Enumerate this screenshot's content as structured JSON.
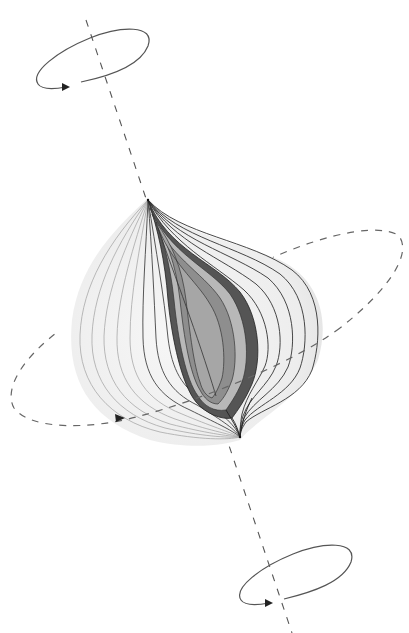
{
  "diagram": {
    "colors": {
      "background": "#ffffff",
      "axis": "#555555",
      "ring": "#555555",
      "equator_ring": "#666666",
      "field_line": "#222222",
      "faint_line": "#999999",
      "halo": "#ececec",
      "shell_dark": "#555555",
      "shell_mid": "#8a8a8a",
      "shell_light": "#b4b4b4",
      "shell_core": "#a0a0a0"
    },
    "axis": {
      "x1": 86,
      "y1": 20,
      "x2": 292,
      "y2": 633
    },
    "top_cusp": {
      "x": 148,
      "y": 200
    },
    "bottom_cusp": {
      "x": 240,
      "y": 437
    },
    "rings": [
      {
        "name": "top-rotation-ring",
        "cx": 93,
        "cy": 57,
        "rx": 58,
        "ry": 18,
        "rotate": -22
      },
      {
        "name": "bottom-rotation-ring",
        "cx": 296,
        "cy": 573,
        "rx": 58,
        "ry": 18,
        "rotate": -22
      },
      {
        "name": "equatorial-ring",
        "cx": 201,
        "cy": 326,
        "rx": 202,
        "ry": 60,
        "rotate": -22
      }
    ]
  }
}
